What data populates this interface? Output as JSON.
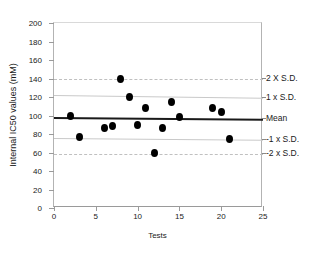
{
  "chart_data": {
    "type": "scatter",
    "title": "",
    "xlabel": "Tests",
    "ylabel": "Internal IC50 values (mM)",
    "xlim": [
      0,
      25
    ],
    "ylim": [
      0,
      200
    ],
    "xticks": [
      0,
      5,
      10,
      15,
      20,
      25
    ],
    "yticks": [
      0,
      20,
      40,
      60,
      80,
      100,
      120,
      140,
      160,
      180,
      200
    ],
    "grid": false,
    "legend": "none",
    "point_color": "#000000",
    "x": [
      2,
      3,
      6,
      7,
      8,
      9,
      10,
      11,
      12,
      13,
      14,
      15,
      19,
      20,
      21
    ],
    "y": [
      99,
      77,
      87,
      89,
      140,
      120,
      90,
      108,
      59,
      87,
      115,
      98,
      108,
      104,
      75
    ],
    "points": [
      {
        "x": 2,
        "y": 99
      },
      {
        "x": 3,
        "y": 77
      },
      {
        "x": 6,
        "y": 87
      },
      {
        "x": 7,
        "y": 89
      },
      {
        "x": 8,
        "y": 140
      },
      {
        "x": 9,
        "y": 120
      },
      {
        "x": 10,
        "y": 90
      },
      {
        "x": 11,
        "y": 108
      },
      {
        "x": 12,
        "y": 59
      },
      {
        "x": 13,
        "y": 87
      },
      {
        "x": 14,
        "y": 115
      },
      {
        "x": 15,
        "y": 98
      },
      {
        "x": 19,
        "y": 108
      },
      {
        "x": 20,
        "y": 104
      },
      {
        "x": 21,
        "y": 75
      }
    ],
    "reference_lines": [
      {
        "id": "plus2sd",
        "label": "2 X S.D.",
        "y_left": 139,
        "y_right": 139,
        "style": "dashed",
        "color": "#c0c0c0"
      },
      {
        "id": "plus1sd",
        "label": "1 x S.D.",
        "y_left": 122,
        "y_right": 119,
        "style": "solid",
        "color": "#c9c9c9"
      },
      {
        "id": "mean",
        "label": "Mean",
        "y_left": 98,
        "y_right": 96,
        "style": "bold",
        "color": "#1a1a1a"
      },
      {
        "id": "minus1sd",
        "label": "-1 x S.D.",
        "y_left": 76,
        "y_right": 74,
        "style": "solid",
        "color": "#c9c9c9"
      },
      {
        "id": "minus2sd",
        "label": "-2 x S.D.",
        "y_left": 58,
        "y_right": 58,
        "style": "dashed",
        "color": "#c0c0c0"
      }
    ]
  },
  "axis": {
    "y_title": "Internal IC50 values (mM)",
    "x_title": "Tests",
    "y_tick_labels": [
      "200",
      "180",
      "160",
      "140",
      "120",
      "100",
      "80",
      "60",
      "40",
      "20",
      "0"
    ],
    "x_tick_labels": [
      "0",
      "5",
      "10",
      "15",
      "20",
      "25"
    ]
  },
  "annotations": {
    "plus2sd": "2 X S.D.",
    "plus1sd": "1 x S.D.",
    "mean": "Mean",
    "minus1sd": "-1 x S.D.",
    "minus2sd": "-2 x S.D."
  }
}
